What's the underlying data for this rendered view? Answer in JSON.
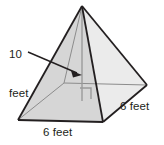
{
  "figure": {
    "name": "square-pyramid-diagram",
    "shape": "square pyramid",
    "background_color": "#ffffff",
    "outline_color": "#231f20",
    "hidden_edge_color": "#8c8c8c",
    "face_left_fill": "#d9d9d9",
    "face_right_fill": "#ededed",
    "base_left_fill": "#e4e4e4",
    "base_right_fill": "#d2d2d2",
    "labels": {
      "height_line1": "10",
      "height_line2": "feet",
      "base_front": "6 feet",
      "base_right": "6 feet"
    },
    "annotations": {
      "arrow_name": "height-arrow",
      "right_angle_name": "right-angle-marker"
    },
    "geometry": {
      "apex": [
        82,
        6
      ],
      "base_left": [
        18,
        120
      ],
      "base_front": [
        103,
        122
      ],
      "base_right": [
        147,
        85
      ],
      "base_back_hidden": [
        64,
        83
      ],
      "base_center": [
        82,
        101
      ],
      "arrow_start": [
        28,
        52
      ],
      "arrow_end": [
        82,
        74
      ]
    }
  }
}
